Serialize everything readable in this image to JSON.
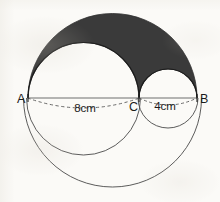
{
  "figure": {
    "background_color": "#fbfaf7",
    "stroke_color": "#1b1b1b",
    "shade_color": "#3a3a3a",
    "baseline_color": "#6e6e6e",
    "dash_color": "#5a5a5a"
  },
  "points": [
    {
      "id": "A",
      "label": "A",
      "x": 28,
      "y": 98,
      "label_x": 17,
      "label_y": 103
    },
    {
      "id": "C",
      "label": "C",
      "x": 139,
      "y": 98,
      "label_x": 129,
      "label_y": 111
    },
    {
      "id": "B",
      "label": "B",
      "x": 197,
      "y": 98,
      "label_x": 200,
      "label_y": 103
    }
  ],
  "measurements": [
    {
      "id": "AC",
      "label": "8cm",
      "label_x": 85,
      "label_y": 112,
      "segment": "A-C",
      "value": 8,
      "unit": "cm"
    },
    {
      "id": "CB",
      "label": "4cm",
      "label_x": 165,
      "label_y": 110,
      "segment": "C-B",
      "value": 4,
      "unit": "cm"
    }
  ],
  "geometry": {
    "baseline": {
      "x1": 28,
      "y1": 98,
      "x2": 197,
      "y2": 98
    },
    "semicircle_big_top": {
      "cx": 112.5,
      "cy": 98,
      "r": 84.5,
      "side": "top",
      "filled": true
    },
    "semicircle_medium_top": {
      "cx": 83.5,
      "cy": 98,
      "r": 55.5,
      "side": "top",
      "filled": false
    },
    "semicircle_small_top": {
      "cx": 168.0,
      "cy": 98,
      "r": 29.0,
      "side": "top",
      "filled": false
    },
    "semicircle_big_bottom": {
      "cx": 112.5,
      "cy": 98,
      "r": 89.0,
      "side": "bottom",
      "filled": false
    },
    "semicircle_medium_bottom": {
      "cx": 83.5,
      "cy": 98,
      "r": 57.0,
      "side": "bottom",
      "filled": false
    },
    "semicircle_small_bottom": {
      "cx": 168.0,
      "cy": 98,
      "r": 30.0,
      "side": "bottom",
      "filled": false
    },
    "dashed_arc_ac": {
      "cx": 83.5,
      "cy": 98,
      "r": 56.0,
      "side": "bottom",
      "sagitta": 10
    },
    "dashed_arc_cb": {
      "cx": 168.0,
      "cy": 98,
      "r": 29.0,
      "side": "bottom",
      "sagitta": 7
    }
  },
  "chart_data": {
    "type": "diagram",
    "labels": [
      "A",
      "C",
      "B",
      "8cm",
      "4cm"
    ],
    "segments": [
      {
        "name": "AC",
        "length": 8,
        "unit": "cm"
      },
      {
        "name": "CB",
        "length": 4,
        "unit": "cm"
      },
      {
        "name": "AB",
        "length": 12,
        "unit": "cm"
      }
    ],
    "shaded_region": "arbelos (above baseline)"
  }
}
